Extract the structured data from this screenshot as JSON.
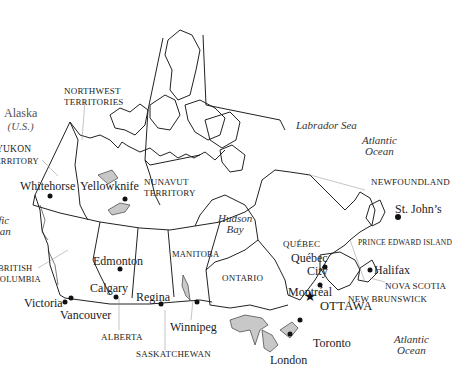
{
  "map": {
    "title": "Canada",
    "regions": {
      "alaska": {
        "name": "Alaska",
        "note": "(U.S.)"
      },
      "yukon": {
        "line1": "Yukon",
        "line2": "Territory"
      },
      "nwt": {
        "line1": "Northwest",
        "line2": "Territories"
      },
      "nunavut": {
        "line1": "Nunavut",
        "line2": "Territory"
      },
      "bc": {
        "line1": "British",
        "line2": "Columbia"
      },
      "alberta": "Alberta",
      "saskatchewan": "Saskatchewan",
      "manitoba": "Manitoba",
      "ontario": "Ontario",
      "quebec": "Québec",
      "newfoundland": "Newfoundland",
      "pei": "Prince Edward Island",
      "nova_scotia": "Nova Scotia",
      "new_brunswick": "New Brunswick"
    },
    "water": {
      "labrador_sea": "Labrador Sea",
      "atlantic_north": {
        "line1": "Atlantic",
        "line2": "Ocean"
      },
      "atlantic_south": {
        "line1": "Atlantic",
        "line2": "Ocean"
      },
      "pacific": {
        "line1": "Pacific",
        "line2": "Ocean"
      },
      "hudson_bay": {
        "line1": "Hudson",
        "line2": "Bay"
      }
    },
    "cities": {
      "whitehorse": "Whitehorse",
      "yellowknife": "Yellowknife",
      "edmonton": "Edmonton",
      "calgary": "Calgary",
      "regina": "Regina",
      "winnipeg": "Winnipeg",
      "victoria": "Victoria",
      "vancouver": "Vancouver",
      "quebec_city": {
        "line1": "Québec",
        "line2": "City"
      },
      "montreal": "Montréal",
      "ottawa": "OTTAWA",
      "toronto": "Toronto",
      "london": "London",
      "halifax": "Halifax",
      "st_johns": "St. John’s"
    },
    "colors": {
      "line": "#222222",
      "lake_fill": "#c8c8c8",
      "background": "#ffffff"
    }
  }
}
